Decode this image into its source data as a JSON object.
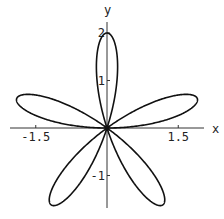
{
  "chart_data": {
    "type": "line",
    "title": "",
    "equation": "r = 2 sin(5θ)",
    "xlabel": "x",
    "ylabel": "y",
    "xlim": [
      -2.15,
      2.05
    ],
    "ylim": [
      -1.7,
      2.25
    ],
    "x_ticks": [
      {
        "value": -1.5,
        "label": "-1.5"
      },
      {
        "value": 1.5,
        "label": "1.5"
      }
    ],
    "y_ticks": [
      {
        "value": 2,
        "label": "2"
      },
      {
        "value": 1,
        "label": "1"
      },
      {
        "value": -1,
        "label": "-1"
      }
    ],
    "grid": false,
    "legend": null,
    "series": [
      {
        "name": "rose curve",
        "polar": {
          "amplitude": 2,
          "k": 5,
          "func": "sin"
        },
        "petal_tips": [
          {
            "x": 0.0,
            "y": 2.0
          },
          {
            "x": 1.902,
            "y": 0.618
          },
          {
            "x": 1.176,
            "y": -1.618
          },
          {
            "x": -1.176,
            "y": -1.618
          },
          {
            "x": -1.902,
            "y": 0.618
          }
        ],
        "color": "#111111"
      }
    ]
  },
  "layout": {
    "origin_px": [
      107,
      128
    ],
    "scale_px": 47.5,
    "x_axis_px": [
      10,
      204
    ],
    "y_axis_px": [
      22,
      208
    ]
  }
}
